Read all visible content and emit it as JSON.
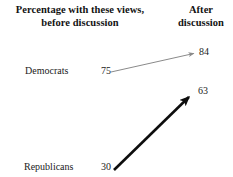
{
  "header": {
    "left_title_line1": "Percentage with these views,",
    "left_title_line2": "before discussion",
    "right_title_line1": "After",
    "right_title_line2": "discussion"
  },
  "chart_data": {
    "type": "line",
    "title": "Percentage with these views, before discussion",
    "subtitle": "After discussion",
    "xlabel": "",
    "ylabel": "",
    "categories": [
      "before discussion",
      "after discussion"
    ],
    "series": [
      {
        "name": "Democrats",
        "before": 75,
        "after": 84,
        "before_label": "75",
        "after_label": "84",
        "color": "#8a8a8a",
        "line_width": 1,
        "arrow": {
          "x1": 111,
          "y1": 72,
          "x2": 196,
          "y2": 53
        }
      },
      {
        "name": "Republicans",
        "before": 30,
        "after": 63,
        "before_label": "30",
        "after_label": "63",
        "color": "#0d0d0d",
        "line_width": 2.6,
        "arrow": {
          "x1": 114,
          "y1": 170,
          "x2": 193,
          "y2": 93
        }
      }
    ],
    "grid": false,
    "legend": "none",
    "annotations": [
      "Democrats 75 → 84",
      "Republicans 30 → 63"
    ]
  },
  "rows": [
    {
      "label": "Democrats",
      "before": "75",
      "after": "84"
    },
    {
      "label": "Republicans",
      "before": "30",
      "after": "63"
    }
  ]
}
